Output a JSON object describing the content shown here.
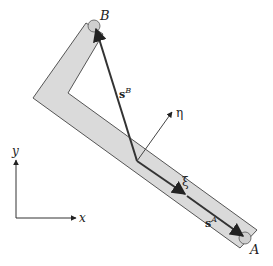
{
  "diagram": {
    "colors": {
      "body_fill": "#dadada",
      "body_stroke": "#555555",
      "vector": "#333333",
      "axis": "#333333",
      "point_fill": "#cfcfcf"
    },
    "labels": {
      "point_B": "B",
      "point_A": "A",
      "vector_sB_base": "s",
      "vector_sB_sup": "B",
      "vector_sA_base": "s",
      "vector_sA_sup": "A",
      "local_axis_xi": "ξ",
      "local_axis_eta": "η",
      "global_axis_x": "x",
      "global_axis_y": "y"
    }
  }
}
